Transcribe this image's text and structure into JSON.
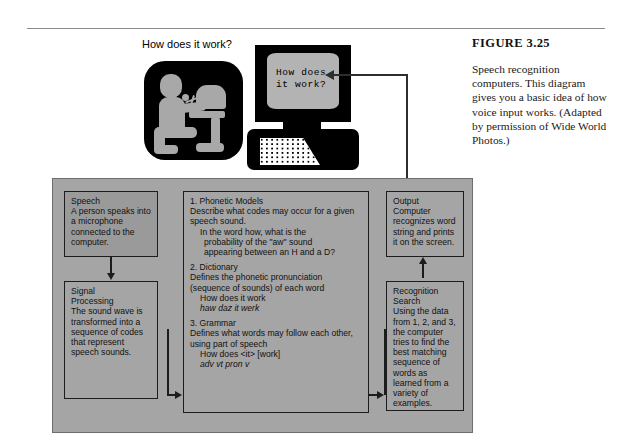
{
  "figure": {
    "label": "FIGURE 3.25",
    "caption": "Speech recognition computers. This diagram gives you a basic idea of how voice input works. (Adapted by permission of Wide World Photos.)"
  },
  "illustration": {
    "question_label": "How does it work?",
    "monitor_screen_text": "How does\nit work?",
    "person_icon": "person-at-computer-icon",
    "computer_icon": "desktop-computer-icon"
  },
  "diagram": {
    "boxes": [
      {
        "id": "speech",
        "title": "Speech",
        "body": "A person speaks into a microphone connected to the computer."
      },
      {
        "id": "signal_processing",
        "title_line1": "Signal",
        "title_line2": "Processing",
        "body": "The sound wave is transformed into a sequence of codes that represent speech sounds."
      },
      {
        "id": "phonetic_models",
        "title": "1. Phonetic Models",
        "line1": "Describe what codes may occur",
        "line2": "for a given speech sound.",
        "example_line1": "In the word how, what is the",
        "example_line2": "probability of the \"aw\" sound",
        "example_line3": "appearing between an H and a D?"
      },
      {
        "id": "dictionary",
        "title": "2. Dictionary",
        "line1": "Defines the phonetic pronunciation",
        "line2": "(sequence of sounds) of each word",
        "example_words": "How does it work",
        "example_phonetic": "haw   daz    it  werk"
      },
      {
        "id": "grammar",
        "title": "3. Grammar",
        "line1": "Defines what words may follow",
        "line2": "each other, using part of speech",
        "example_sentence": "How does  <it>  [work]",
        "example_tags": "adv   vt      pron     v"
      },
      {
        "id": "output",
        "title": "Output",
        "body": "Computer recognizes word string and prints it on the screen."
      },
      {
        "id": "recognition_search",
        "title_line1": "Recognition",
        "title_line2": "Search",
        "body": "Using the data from 1, 2, and 3, the computer tries to find the best matching sequence of words as learned from a variety of examples."
      }
    ]
  },
  "colors": {
    "panel_background": "#a5a5a5",
    "shaded_box": "#9a9a9a",
    "box_border": "#1c1c1c",
    "icon_black": "#000000",
    "icon_gray": "#a8a8a8",
    "screen_gray": "#b3b3b3"
  }
}
